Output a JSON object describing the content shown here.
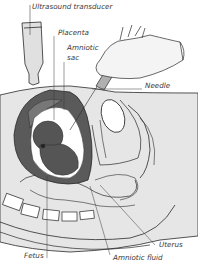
{
  "diagram": {
    "colors": {
      "body_fill": "#e6e6e6",
      "uterus_wall": "#5a5a5a",
      "fetus": "#555555",
      "line": "#2a2a2a",
      "label_text": "#3a3a3a"
    },
    "labels": [
      {
        "id": "ultrasound-transducer",
        "text": "Ultrasound transducer"
      },
      {
        "id": "placenta",
        "text": "Placenta"
      },
      {
        "id": "amniotic-sac-1",
        "text": "Amniotic"
      },
      {
        "id": "amniotic-sac-2",
        "text": "sac"
      },
      {
        "id": "needle",
        "text": "Needle"
      },
      {
        "id": "uterus",
        "text": "Uterus"
      },
      {
        "id": "fetus",
        "text": "Fetus"
      },
      {
        "id": "amniotic-fluid",
        "text": "Amniotic fluid"
      }
    ]
  }
}
